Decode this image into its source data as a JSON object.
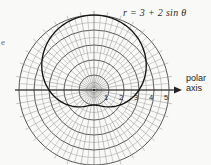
{
  "figure": {
    "equation_label": "r = 3 + 2 sin θ",
    "polar_axis_word1": "polar",
    "polar_axis_word2": "axis",
    "radial_tick_labels": [
      "1",
      "2",
      "3",
      "4",
      "5"
    ],
    "stray_text_fragment": "e"
  },
  "chart_data": {
    "type": "line",
    "coordinate_system": "polar",
    "title": "r = 3 + 2 sin θ",
    "equation": {
      "formula": "r = 3 + 2 sin θ",
      "a": 3,
      "b": 2,
      "trig": "sin"
    },
    "series": [
      {
        "name": "r = 3 + 2 sin θ",
        "theta_deg": [
          0,
          30,
          60,
          90,
          120,
          150,
          180,
          210,
          240,
          270,
          300,
          330,
          360
        ],
        "r": [
          3,
          4,
          4.73,
          5,
          4.73,
          4,
          3,
          2,
          1.27,
          1,
          1.27,
          2,
          3
        ]
      }
    ],
    "radial_ticks": [
      1,
      2,
      3,
      4,
      5
    ],
    "r_max_grid": 5,
    "axis_label": "polar axis",
    "legend": "none",
    "grid": {
      "visible": true,
      "circle_step": 0.5,
      "spoke_step_deg": 10,
      "outer_spoke_step_deg": 5,
      "outer_spoke_start_r": 2.5,
      "tick_extension_px": 4
    }
  },
  "colors": {
    "background": "#f9f9f7",
    "minor_grid": "#999999",
    "major_grid": "#454545",
    "spoke": "#8a8a8a",
    "quadrant_spoke": "#6a6a6a",
    "axis": "#242424",
    "curve": "#141414",
    "text": "#1f1f1f"
  }
}
